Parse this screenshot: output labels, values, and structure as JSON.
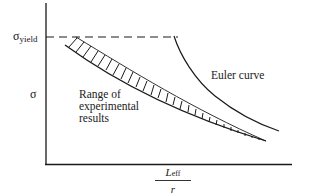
{
  "diagram": {
    "title": "",
    "y_axis": {
      "label": "σ",
      "tick_label_main": "σ",
      "tick_label_sub": "yield"
    },
    "x_axis": {
      "numerator_main": "L",
      "numerator_sub": "eff",
      "denominator": "r"
    },
    "annotations": {
      "region": "Range of\nexperimental\nresults",
      "euler": "Euler curve"
    },
    "elements": [
      {
        "type": "dashed-line",
        "name": "yield-stress-line",
        "from": [
          46,
          37
        ],
        "to": [
          178,
          37
        ]
      },
      {
        "type": "curve",
        "name": "euler-curve",
        "from": [
          174,
          37
        ],
        "to": [
          279,
          131
        ]
      },
      {
        "type": "hatched-band",
        "name": "experimental-range",
        "from": [
          66,
          37
        ],
        "to": [
          266,
          141
        ]
      }
    ],
    "colors": {
      "ink": "#1a1a1a",
      "background": "#ffffff"
    }
  }
}
